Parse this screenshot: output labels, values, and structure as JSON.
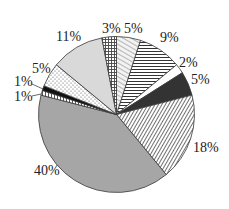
{
  "chart_data": {
    "type": "pie",
    "title": "",
    "start_angle_deg": 0,
    "direction": "clockwise",
    "slices": [
      {
        "label": "5%",
        "value": 5,
        "pattern": "diag-light",
        "fill": "#e8e8e8"
      },
      {
        "label": "9%",
        "value": 9,
        "pattern": "horizontal",
        "fill": "#ffffff"
      },
      {
        "label": "2%",
        "value": 2,
        "pattern": "solid",
        "fill": "#ffffff"
      },
      {
        "label": "5%",
        "value": 5,
        "pattern": "solid",
        "fill": "#333333"
      },
      {
        "label": "18%",
        "value": 18,
        "pattern": "diag-dense",
        "fill": "#ffffff"
      },
      {
        "label": "40%",
        "value": 40,
        "pattern": "solid",
        "fill": "#a6a6a6"
      },
      {
        "label": "1%",
        "value": 1,
        "pattern": "vertical",
        "fill": "#ffffff"
      },
      {
        "label": "1%",
        "value": 1,
        "pattern": "solid",
        "fill": "#111111"
      },
      {
        "label": "5%",
        "value": 5,
        "pattern": "dots",
        "fill": "#ffffff"
      },
      {
        "label": "11%",
        "value": 11,
        "pattern": "solid",
        "fill": "#d9d9d9"
      },
      {
        "label": "3%",
        "value": 3,
        "pattern": "grid",
        "fill": "#ffffff"
      }
    ],
    "values": [
      5,
      9,
      2,
      5,
      18,
      40,
      1,
      1,
      5,
      11,
      3
    ],
    "categories": [
      "5%",
      "9%",
      "2%",
      "5%",
      "18%",
      "40%",
      "1%",
      "1%",
      "5%",
      "11%",
      "3%"
    ],
    "legend": "none",
    "data_labels": "outside"
  },
  "labels": {
    "s0": "5%",
    "s1": "9%",
    "s2": "2%",
    "s3": "5%",
    "s4": "18%",
    "s5": "40%",
    "s6": "1%",
    "s7": "1%",
    "s8": "5%",
    "s9": "11%",
    "s10": "3%"
  }
}
